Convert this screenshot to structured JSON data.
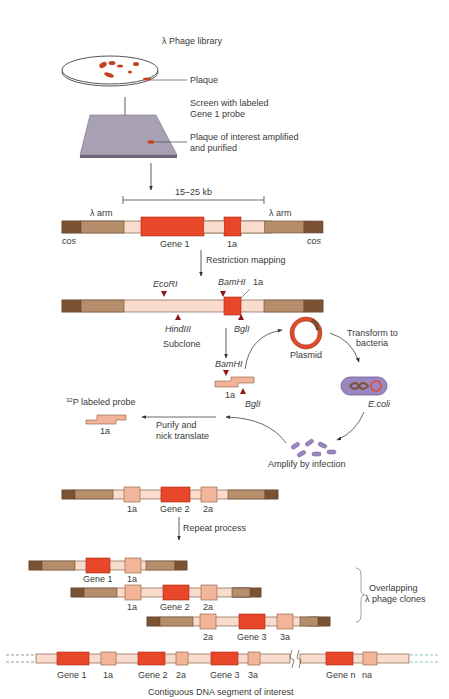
{
  "colors": {
    "cos": "#7a5234",
    "arm": "#b58e6b",
    "insert": "#f9dccb",
    "gene": "#e8472a",
    "marker": "#f3b59a",
    "site": "#8b1a1a",
    "membrane": "#9a86c0",
    "plate": "#a7a1b3",
    "text": "#3a3a3a"
  },
  "top": {
    "library_label": "λ Phage library",
    "plaque_label": "Plaque",
    "screen_label_1": "Screen  with labeled",
    "screen_label_2": "Gene 1 probe",
    "purified_label_1": "Plaque of interest amplified",
    "purified_label_2": "and purified"
  },
  "clone1": {
    "size_label": "15–25 kb",
    "arm_left": "λ arm",
    "arm_right": "λ arm",
    "cos_left": "cos",
    "cos_right": "cos",
    "gene_label": "Gene 1",
    "marker_label": "1a"
  },
  "mapping": {
    "step_label": "Restriction mapping",
    "ecori": "EcoRI",
    "bamhi": "BamHI",
    "marker_label": "1a",
    "hindiii": "HindIII",
    "bgli": "BglI",
    "subclone_label": "Subclone"
  },
  "cycle": {
    "plasmid_label": "Plasmid",
    "transform_label_1": "Transform to",
    "transform_label_2": "bacteria",
    "ecoli_label": "E.coli",
    "amplify_label": "Amplify by infection",
    "fragment_bamhi": "BamHI",
    "fragment_label": "1a",
    "fragment_bgli": "BglI",
    "purify_label_1": "Purify and",
    "purify_label_2": "nick translate",
    "probe_sup": "32",
    "probe_label": "P labeled probe",
    "probe_fragment_label": "1a"
  },
  "clone2": {
    "labels": [
      "1a",
      "Gene 2",
      "2a"
    ],
    "step_label": "Repeat process"
  },
  "overlap": {
    "rows": [
      {
        "labels": [
          "Gene 1",
          "1a"
        ]
      },
      {
        "labels": [
          "1a",
          "Gene 2",
          "2a"
        ]
      },
      {
        "labels": [
          "2a",
          "Gene 3",
          "3a"
        ]
      }
    ],
    "brace_label_1": "Overlapping",
    "brace_label_2": "λ phage clones"
  },
  "contig": {
    "labels": [
      "Gene 1",
      "1a",
      "Gene 2",
      "2a",
      "Gene 3",
      "3a",
      "Gene n",
      "na"
    ],
    "caption": "Contiguous DNA segment of interest"
  }
}
